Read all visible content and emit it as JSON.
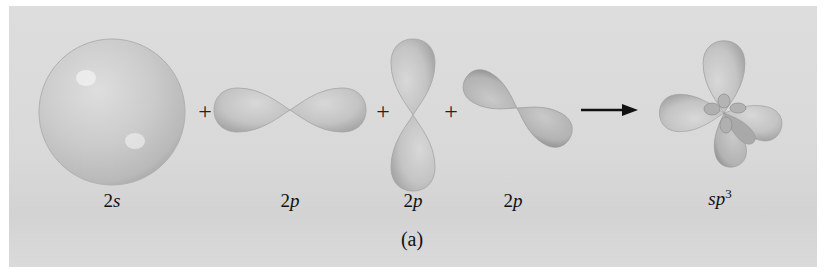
{
  "figure": {
    "caption": "(a)",
    "colors": {
      "background": "#d9d9d9",
      "orbital_fill": "#c7c7c7",
      "orbital_shadow": "#a8a8a8",
      "text": "#111111"
    },
    "equation": {
      "operators": [
        "+",
        "+",
        "+"
      ],
      "arrow": "→"
    },
    "orbitals": [
      {
        "id": "2s",
        "label_prefix": "2",
        "label_italic": "s",
        "shape": "sphere"
      },
      {
        "id": "2p-x",
        "label_prefix": "2",
        "label_italic": "p",
        "shape": "dumbbell-horizontal"
      },
      {
        "id": "2p-y",
        "label_prefix": "2",
        "label_italic": "p",
        "shape": "dumbbell-vertical"
      },
      {
        "id": "2p-z",
        "label_prefix": "2",
        "label_italic": "p",
        "shape": "dumbbell-diagonal"
      }
    ],
    "result": {
      "label_italic": "sp",
      "superscript": "3",
      "shape": "tetrahedral-hybrid"
    }
  }
}
